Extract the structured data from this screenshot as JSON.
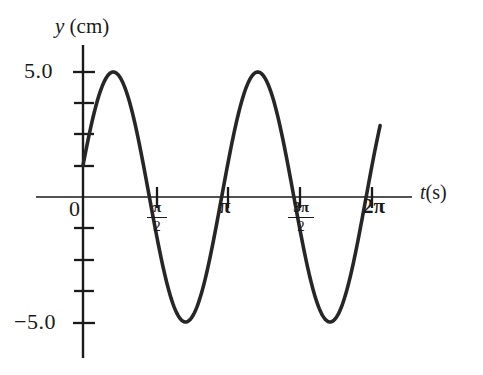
{
  "figure": {
    "background": "#ffffff",
    "curve_color": "#262626",
    "axis_color": "#1a1a1a"
  },
  "axes": {
    "y_axis_title": "y (cm)",
    "y_axis_variable": "y",
    "y_axis_unit": "(cm)",
    "x_axis_title": "t (s)",
    "x_axis_variable": "t",
    "x_axis_unit": "(s)",
    "y_tick_top_label": "5.0",
    "y_tick_bottom_label": "−5.0",
    "origin_label": "0",
    "x_tick_pi_label": "π",
    "x_tick_2pi_label": "2π",
    "x_tick_pi_over_2": {
      "numerator": "π",
      "denominator": "2"
    },
    "x_tick_3pi_over_2": {
      "numerator": "3π",
      "denominator": "2"
    }
  },
  "chart_data": {
    "type": "line",
    "title": "",
    "subtitle": "",
    "xlabel": "t (s)",
    "ylabel": "y (cm)",
    "xlim": [
      0,
      6.6
    ],
    "ylim": [
      -6.6,
      6.6
    ],
    "grid": false,
    "legend": null,
    "x_tick_values": [
      0,
      1.5708,
      3.1416,
      4.7124,
      6.2832
    ],
    "x_tick_labels": [
      "0",
      "π/2",
      "π",
      "3π/2",
      "2π"
    ],
    "y_tick_values": [
      -6.25,
      -5.0,
      -3.75,
      -2.5,
      -1.25,
      0,
      1.25,
      2.5,
      3.75,
      5.0,
      6.25
    ],
    "y_tick_labels": [
      "",
      "−5.0",
      "",
      "",
      "",
      "0",
      "",
      "",
      "",
      "5.0",
      ""
    ],
    "y_labeled_ticks": [
      -5.0,
      5.0
    ],
    "function": "y = 5.0 sin(2t + 0.2546)",
    "amplitude": 5.0,
    "period": 3.1416,
    "angular_frequency": 2.0,
    "phase_rad": 0.2546,
    "y_at_t0": 1.26,
    "cycles_shown": 2,
    "series": [
      {
        "name": "y(t)",
        "color": "#262626",
        "line_width": 3.6,
        "x": [
          0.0,
          0.1,
          0.2,
          0.3,
          0.4,
          0.5,
          0.6,
          0.7,
          0.8,
          0.9,
          1.0,
          1.1,
          1.2,
          1.3,
          1.4,
          1.5,
          1.6,
          1.7,
          1.8,
          1.9,
          2.0,
          2.1,
          2.2,
          2.3,
          2.4,
          2.5,
          2.6,
          2.7,
          2.8,
          2.9,
          3.0,
          3.1,
          3.2,
          3.3,
          3.4,
          3.5,
          3.6,
          3.7,
          3.8,
          3.9,
          4.0,
          4.1,
          4.2,
          4.3,
          4.4,
          4.5,
          4.6,
          4.7,
          4.8,
          4.9,
          5.0,
          5.1,
          5.2,
          5.3,
          5.4,
          5.5,
          5.6,
          5.7,
          5.8,
          5.9,
          6.0,
          6.1,
          6.2,
          6.3,
          6.4
        ],
        "y": [
          1.26,
          2.2,
          3.06,
          3.8,
          4.39,
          4.8,
          4.99,
          4.98,
          4.75,
          4.32,
          3.71,
          2.95,
          2.09,
          1.16,
          0.2,
          -0.76,
          -1.7,
          -2.58,
          -3.37,
          -4.05,
          -4.58,
          -4.88,
          -4.99,
          -4.92,
          -4.65,
          -4.2,
          -3.58,
          -2.83,
          -1.97,
          -1.05,
          -0.1,
          0.87,
          1.81,
          2.69,
          3.48,
          4.14,
          4.65,
          4.92,
          4.99,
          4.9,
          4.62,
          4.15,
          3.52,
          2.75,
          1.88,
          0.95,
          -0.01,
          -0.97,
          -1.87,
          -2.7,
          -3.43,
          -4.1,
          -4.6,
          -4.91,
          -4.99,
          -4.9,
          -4.62,
          -4.15,
          -3.52,
          -2.75,
          -1.89,
          -0.95,
          0.01,
          0.97,
          1.88
        ]
      }
    ],
    "maxima": [
      {
        "t": 0.66,
        "y": 5.0
      },
      {
        "t": 3.8,
        "y": 5.0
      }
    ],
    "minima": [
      {
        "t": 2.23,
        "y": -5.0
      },
      {
        "t": 5.37,
        "y": -5.0
      }
    ],
    "zero_crossings": [
      1.44,
      3.01,
      4.58,
      6.15
    ]
  }
}
